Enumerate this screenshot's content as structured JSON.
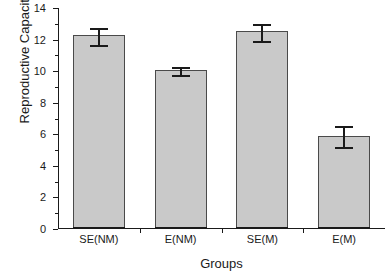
{
  "chart_data": {
    "type": "bar",
    "title": "",
    "xlabel": "Groups",
    "ylabel": "Reproductive Capacity",
    "categories": [
      "SE(NM)",
      "E(NM)",
      "SE(M)",
      "E(M)"
    ],
    "values": [
      12.2,
      10.0,
      12.45,
      5.85
    ],
    "errors": [
      0.55,
      0.25,
      0.55,
      0.65
    ],
    "ylim": [
      0,
      14
    ],
    "ytick_labels": [
      "0",
      "2",
      "4",
      "6",
      "8",
      "10",
      "12",
      "14"
    ],
    "ytick_values": [
      0,
      2,
      4,
      6,
      8,
      10,
      12,
      14
    ],
    "yminor_values": [
      1,
      3,
      5,
      7,
      9,
      11,
      13
    ],
    "grid": false,
    "legend": "none",
    "series": [
      {
        "name": "Reproductive Capacity",
        "values": [
          12.2,
          10.0,
          12.45,
          5.85
        ],
        "errors": [
          0.55,
          0.25,
          0.55,
          0.65
        ],
        "color": "#c9c9c9",
        "edge_color": "#4a4a4a"
      }
    ]
  },
  "style": {
    "bar_fill": "#c9c9c9",
    "bar_edge": "#4a4a4a",
    "axis_color": "#1a1a1a",
    "error_color": "#1a1a1a",
    "background": "#ffffff"
  }
}
